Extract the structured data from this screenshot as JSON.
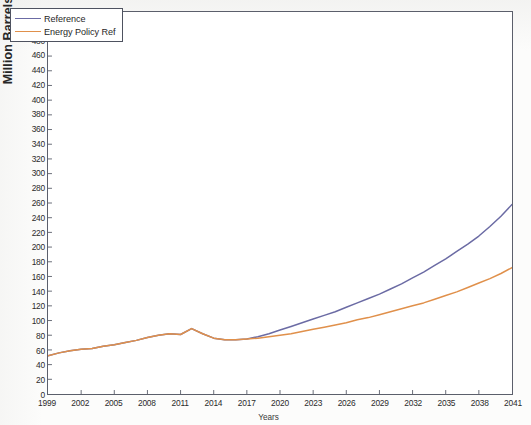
{
  "chart_data": {
    "type": "line",
    "title": "",
    "xlabel": "Years",
    "ylabel": "Million Barrels of Oil Equivalents",
    "xlim": [
      1999,
      2041
    ],
    "ylim": [
      0,
      520
    ],
    "ytick_step": 20,
    "xtick_step": 3,
    "grid": false,
    "legend_position": "upper left",
    "yticks": [
      0,
      20,
      40,
      60,
      80,
      100,
      120,
      140,
      160,
      180,
      200,
      220,
      240,
      260,
      280,
      300,
      320,
      340,
      360,
      380,
      400,
      420,
      440,
      460,
      480,
      500,
      520
    ],
    "xticks": [
      1999,
      2002,
      2005,
      2008,
      2011,
      2014,
      2017,
      2020,
      2023,
      2026,
      2029,
      2032,
      2035,
      2038,
      2041
    ],
    "x": [
      1999,
      2000,
      2001,
      2002,
      2003,
      2004,
      2005,
      2006,
      2007,
      2008,
      2009,
      2010,
      2011,
      2012,
      2013,
      2014,
      2015,
      2016,
      2017,
      2018,
      2019,
      2020,
      2021,
      2022,
      2023,
      2024,
      2025,
      2026,
      2027,
      2028,
      2029,
      2030,
      2031,
      2032,
      2033,
      2034,
      2035,
      2036,
      2037,
      2038,
      2039,
      2040,
      2041
    ],
    "series": [
      {
        "name": "Reference",
        "color": "#6b6ba4",
        "values": [
          52,
          56,
          59,
          61,
          62,
          65,
          67,
          70,
          73,
          77,
          80,
          82,
          81,
          89,
          82,
          76,
          74,
          74,
          75,
          78,
          82,
          87,
          92,
          97,
          102,
          107,
          112,
          118,
          124,
          130,
          136,
          143,
          150,
          158,
          166,
          175,
          184,
          194,
          204,
          215,
          228,
          242,
          258
        ]
      },
      {
        "name": "Energy Policy Ref",
        "color": "#e0904b",
        "values": [
          52,
          56,
          59,
          61,
          62,
          65,
          67,
          70,
          73,
          77,
          80,
          82,
          81,
          89,
          82,
          76,
          74,
          74,
          75,
          76,
          78,
          80,
          82,
          85,
          88,
          91,
          94,
          97,
          101,
          104,
          108,
          112,
          116,
          120,
          124,
          129,
          134,
          139,
          145,
          151,
          157,
          164,
          172
        ]
      }
    ]
  },
  "legend": {
    "items": [
      {
        "label": "Reference",
        "color": "#6b6ba4"
      },
      {
        "label": "Energy Policy Ref",
        "color": "#e0904b"
      }
    ]
  },
  "axis": {
    "y_title": "Million Barrels of Oil Equivalents",
    "x_title": "Years"
  }
}
